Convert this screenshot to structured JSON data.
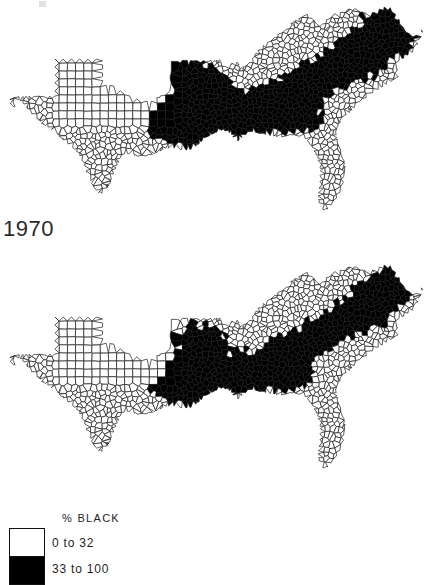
{
  "figure": {
    "type": "choropleth-map-pair"
  },
  "maps": [
    {
      "id": "1970",
      "year_label": "1970"
    },
    {
      "id": "1980",
      "year_label": "1980"
    }
  ],
  "legend": {
    "title": "% BLACK",
    "entries": [
      {
        "label": "0 to 32",
        "color": "#ffffff",
        "range_min": 0,
        "range_max": 32
      },
      {
        "label": "33 to 100",
        "color": "#000000",
        "range_min": 33,
        "range_max": 100
      }
    ]
  },
  "chart_data": {
    "type": "map",
    "title": "% BLACK",
    "subtitle": "",
    "xlabel": "",
    "ylabel": "",
    "panels": [
      "1970",
      "1980"
    ],
    "classes": [
      {
        "label": "0 to 32",
        "color": "#ffffff",
        "min": 0,
        "max": 32
      },
      {
        "label": "33 to 100",
        "color": "#000000",
        "min": 33,
        "max": 100
      }
    ],
    "legend_position": "bottom-left",
    "grid": false
  },
  "colors": {
    "ink": "#1a1a1a",
    "low_class": "#ffffff",
    "high_class": "#000000",
    "paper": "#ffffff"
  }
}
